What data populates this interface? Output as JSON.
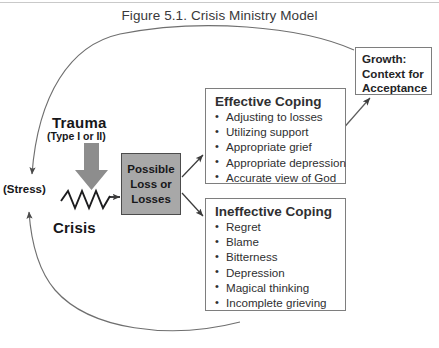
{
  "figure": {
    "title": "Figure 5.1. Crisis Ministry Model"
  },
  "nodes": {
    "trauma": {
      "label": "Trauma",
      "subtitle": "(Type I or II)"
    },
    "crisis": {
      "label": "Crisis"
    },
    "stress": {
      "label": "(Stress)"
    },
    "possible_loss": {
      "line1": "Possible",
      "line2": "Loss or",
      "line3": "Losses",
      "fill": "#a8a8a8"
    },
    "effective_coping": {
      "heading": "Effective Coping",
      "items": [
        "Adjusting to losses",
        "Utilizing support",
        "Appropriate grief",
        "Appropriate depression",
        "Accurate view of God"
      ]
    },
    "ineffective_coping": {
      "heading": "Ineffective Coping",
      "items": [
        "Regret",
        "Blame",
        "Bitterness",
        "Depression",
        "Magical thinking",
        "Incomplete grieving"
      ]
    },
    "growth": {
      "line1": "Growth:",
      "line2": "Context for",
      "line3": "Acceptance"
    }
  },
  "connectors": {
    "trauma_arrow": "thick-down-arrow",
    "crisis_zigzag": "zigzag-line",
    "crisis_to_loss": "arrow-right",
    "loss_to_effective": "arrow-up-right",
    "loss_to_ineffective": "arrow-down-right",
    "effective_to_growth": "arrow-up-right",
    "growth_feedback_loop": "arc-to-stress-top",
    "ineffective_feedback_loop": "arc-to-stress-bottom"
  },
  "colors": {
    "line": "#6b6b6b",
    "text": "#2f2f31",
    "box_border": "#7e7e7e",
    "gray_fill": "#a8a8a8",
    "arrow_gray": "#8d8d8d"
  }
}
